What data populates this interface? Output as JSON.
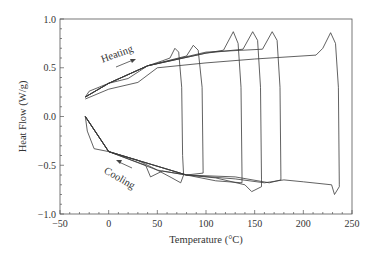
{
  "chart_data": {
    "type": "line",
    "title": "",
    "xlabel": "Temperature (°C)",
    "ylabel": "Heat Flow (W/g)",
    "xlim": [
      -50,
      250
    ],
    "ylim": [
      -1.0,
      1.0
    ],
    "xticks": [
      "−50",
      "0",
      "50",
      "100",
      "150",
      "200",
      "250"
    ],
    "yticks": [
      "1.0",
      "0.5",
      "0.0",
      "−0.5",
      "−1.0"
    ],
    "grid": false,
    "legend": null,
    "annotations": [
      {
        "text": "Heating",
        "x": 5,
        "y": 0.55,
        "arrow": "right-up"
      },
      {
        "text": "Cooling",
        "x": 5,
        "y": -0.55,
        "arrow": "left-up"
      }
    ],
    "series": [
      {
        "name": "cycle to ~75°C",
        "heating": [
          [
            -24,
            0.2
          ],
          [
            -20,
            0.26
          ],
          [
            0,
            0.34
          ],
          [
            20,
            0.39
          ],
          [
            40,
            0.52
          ],
          [
            55,
            0.57
          ],
          [
            63,
            0.6
          ],
          [
            68,
            0.7
          ],
          [
            72,
            0.66
          ],
          [
            75,
            0.3
          ],
          [
            76,
            -0.4
          ],
          [
            77,
            -0.6
          ]
        ],
        "cooling": [
          [
            77,
            -0.6
          ],
          [
            74,
            -0.68
          ],
          [
            65,
            -0.63
          ],
          [
            50,
            -0.55
          ],
          [
            30,
            -0.45
          ],
          [
            0,
            -0.36
          ],
          [
            -15,
            -0.33
          ],
          [
            -22,
            -0.15
          ],
          [
            -24,
            0.0
          ]
        ]
      },
      {
        "name": "cycle to ~95°C",
        "heating": [
          [
            -24,
            0.2
          ],
          [
            0,
            0.34
          ],
          [
            40,
            0.52
          ],
          [
            80,
            0.62
          ],
          [
            87,
            0.73
          ],
          [
            92,
            0.68
          ],
          [
            96,
            0.3
          ],
          [
            97,
            -0.55
          ]
        ],
        "cooling": [
          [
            97,
            -0.58
          ],
          [
            80,
            -0.6
          ],
          [
            55,
            -0.56
          ],
          [
            43,
            -0.62
          ],
          [
            38,
            -0.5
          ],
          [
            0,
            -0.36
          ],
          [
            -24,
            0.0
          ]
        ]
      },
      {
        "name": "cycle to ~135°C",
        "heating": [
          [
            -24,
            0.2
          ],
          [
            0,
            0.34
          ],
          [
            40,
            0.52
          ],
          [
            100,
            0.65
          ],
          [
            118,
            0.68
          ],
          [
            128,
            0.87
          ],
          [
            133,
            0.75
          ],
          [
            136,
            0.3
          ],
          [
            137,
            -0.6
          ]
        ],
        "cooling": [
          [
            137,
            -0.68
          ],
          [
            110,
            -0.66
          ],
          [
            80,
            -0.6
          ],
          [
            50,
            -0.55
          ],
          [
            0,
            -0.36
          ],
          [
            -24,
            0.0
          ]
        ]
      },
      {
        "name": "cycle to ~155°C",
        "heating": [
          [
            -24,
            0.2
          ],
          [
            0,
            0.34
          ],
          [
            40,
            0.52
          ],
          [
            100,
            0.65
          ],
          [
            138,
            0.69
          ],
          [
            148,
            0.87
          ],
          [
            153,
            0.78
          ],
          [
            156,
            0.3
          ],
          [
            157,
            -0.65
          ]
        ],
        "cooling": [
          [
            157,
            -0.72
          ],
          [
            147,
            -0.77
          ],
          [
            140,
            -0.7
          ],
          [
            110,
            -0.63
          ],
          [
            80,
            -0.6
          ],
          [
            0,
            -0.36
          ],
          [
            -24,
            0.0
          ]
        ]
      },
      {
        "name": "cycle to ~175°C",
        "heating": [
          [
            -24,
            0.2
          ],
          [
            0,
            0.34
          ],
          [
            40,
            0.52
          ],
          [
            100,
            0.66
          ],
          [
            158,
            0.69
          ],
          [
            168,
            0.87
          ],
          [
            173,
            0.78
          ],
          [
            176,
            0.3
          ],
          [
            177,
            -0.62
          ]
        ],
        "cooling": [
          [
            177,
            -0.65
          ],
          [
            165,
            -0.68
          ],
          [
            130,
            -0.62
          ],
          [
            80,
            -0.6
          ],
          [
            0,
            -0.36
          ],
          [
            -24,
            0.0
          ]
        ]
      },
      {
        "name": "cycle to ~235°C",
        "heating": [
          [
            -24,
            0.18
          ],
          [
            0,
            0.28
          ],
          [
            30,
            0.35
          ],
          [
            50,
            0.5
          ],
          [
            100,
            0.55
          ],
          [
            150,
            0.59
          ],
          [
            213,
            0.63
          ],
          [
            220,
            0.7
          ],
          [
            228,
            0.86
          ],
          [
            233,
            0.75
          ],
          [
            236,
            0.3
          ],
          [
            237,
            -0.7
          ]
        ],
        "cooling": [
          [
            237,
            -0.72
          ],
          [
            232,
            -0.8
          ],
          [
            229,
            -0.7
          ],
          [
            200,
            -0.67
          ],
          [
            180,
            -0.65
          ],
          [
            160,
            -0.68
          ],
          [
            130,
            -0.64
          ],
          [
            80,
            -0.6
          ],
          [
            0,
            -0.36
          ],
          [
            -24,
            0.0
          ]
        ]
      }
    ]
  }
}
